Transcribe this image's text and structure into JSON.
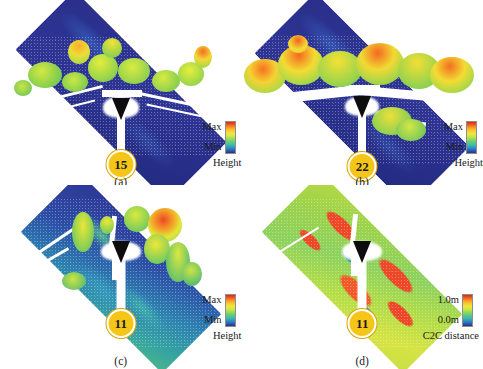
{
  "figure": {
    "background_color": "#ffffff",
    "layout": "2x2 grid of point-cloud visualizations"
  },
  "panels": [
    {
      "id": "a",
      "caption": "(a)",
      "viewpoint_label": "15",
      "scene_type": "height-colored point cloud, roadside vegetation, dark blue ground plane",
      "legend": {
        "max_label": "Max",
        "min_label": "Min",
        "title": "Height",
        "colorbar_top_color": "#d42a1c",
        "colorbar_bottom_color": "#27308c"
      }
    },
    {
      "id": "b",
      "caption": "(b)",
      "viewpoint_label": "22",
      "scene_type": "height-colored point cloud, dense tall trees both sides of road",
      "legend": {
        "max_label": "Max",
        "min_label": "Min",
        "title": "Height",
        "colorbar_top_color": "#d42a1c",
        "colorbar_bottom_color": "#27308c"
      }
    },
    {
      "id": "c",
      "caption": "(c)",
      "viewpoint_label": "11",
      "scene_type": "height-colored point cloud, overhead diamond-shaped plot view",
      "legend": {
        "max_label": "Max",
        "min_label": "Min",
        "title": "Height",
        "colorbar_top_color": "#d42a1c",
        "colorbar_bottom_color": "#27308c"
      }
    },
    {
      "id": "d",
      "caption": "(d)",
      "viewpoint_label": "11",
      "scene_type": "C2C distance heat map over same diamond-shaped plot",
      "legend": {
        "max_label": "1.0m",
        "min_label": "0.0m",
        "title": "C2C distance",
        "colorbar_top_color": "#d42a1c",
        "colorbar_bottom_color": "#27308c"
      }
    }
  ],
  "marker": {
    "badge_fill": "#f5c518",
    "badge_text_color": "#1a1a1a",
    "arrow_color": "#0d0d0d",
    "beam_color": "#ffffff"
  }
}
